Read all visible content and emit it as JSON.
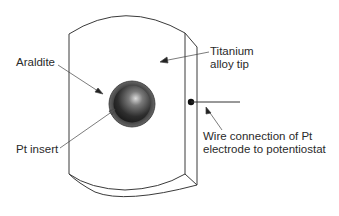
{
  "diagram": {
    "labels": {
      "araldite": "Araldite",
      "pt_insert": "Pt insert",
      "titanium_line1": "Titanium",
      "titanium_line2": "alloy tip",
      "wire_line1": "Wire connection of Pt",
      "wire_line2": "electrode to potentiostat"
    },
    "colors": {
      "stroke": "#3a3a3a",
      "araldite_ring": "#555555",
      "pt_dark": "#1e1e1e",
      "pt_highlight": "#d8d8d8"
    }
  }
}
